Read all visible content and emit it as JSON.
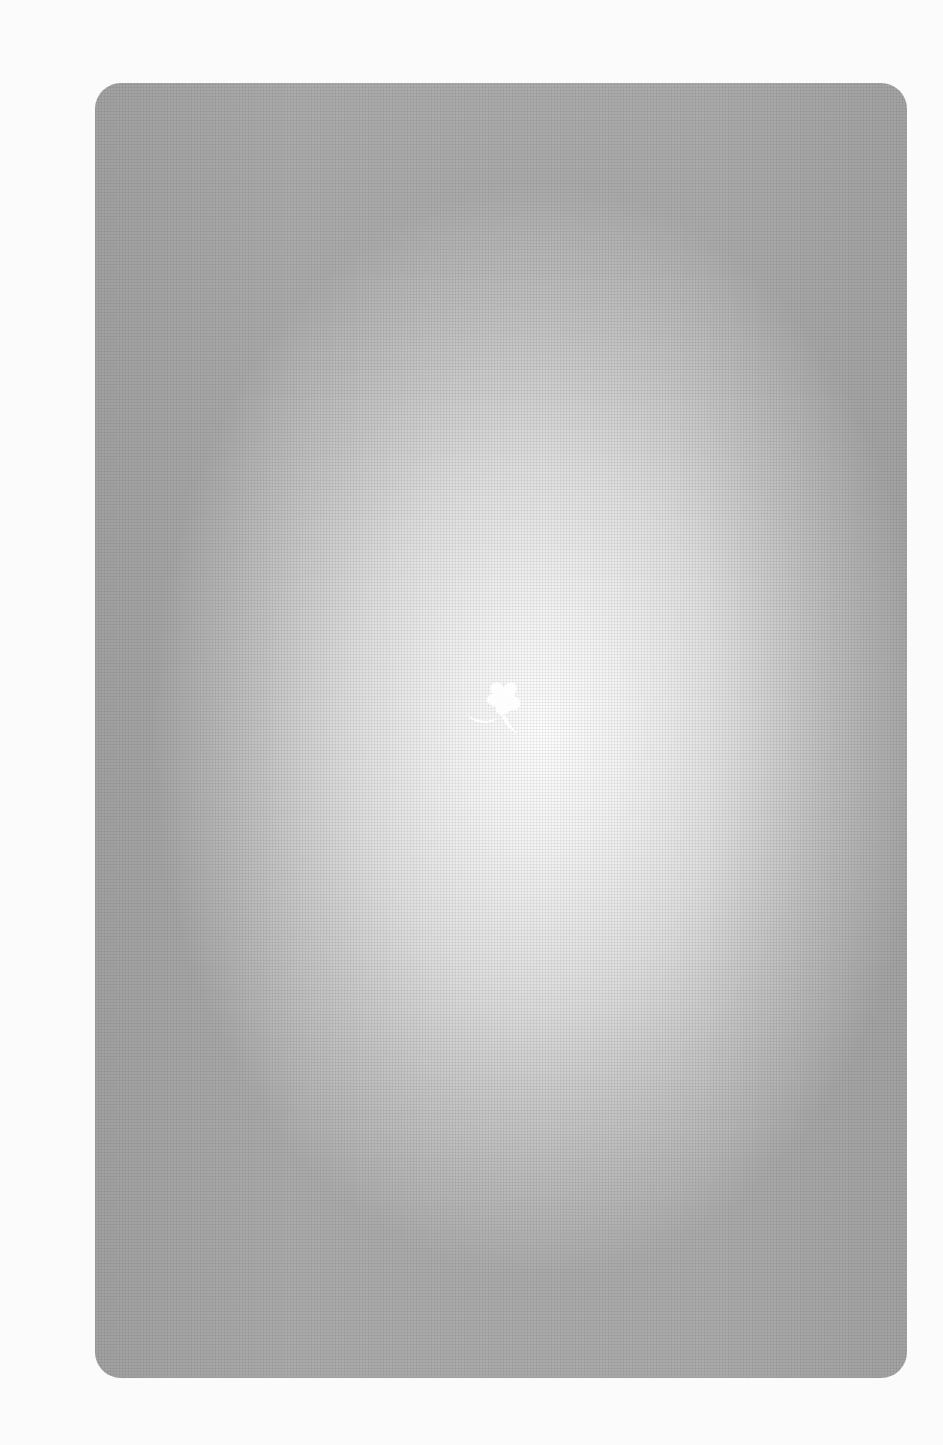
{
  "page": {
    "background_color": "#fbfbfb"
  },
  "card": {
    "edge_color": "#ababab",
    "center_color": "#fdfdfd",
    "corner_radius_px": 26
  },
  "ornament": {
    "icon": "leaf-clover-icon",
    "color": "#ffffff"
  }
}
